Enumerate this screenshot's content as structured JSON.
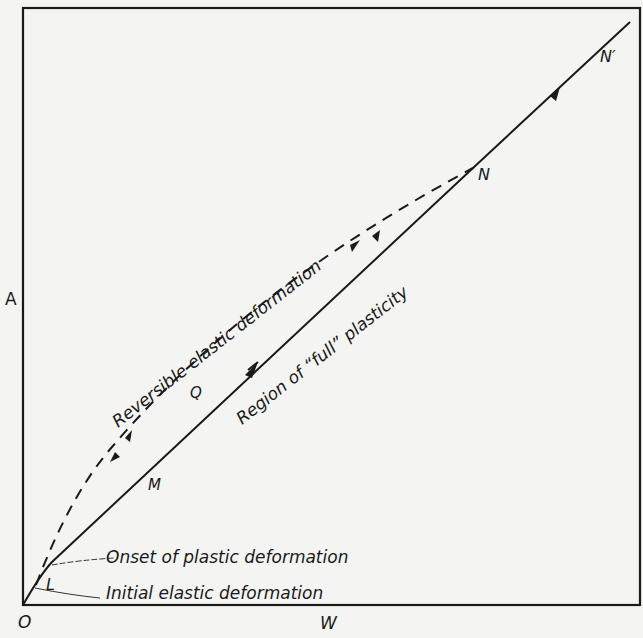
{
  "diagram": {
    "axes": {
      "y_label": "A",
      "x_label": "W",
      "origin_label": "O"
    },
    "points": {
      "L": "L",
      "M": "M",
      "Q": "Q",
      "N": "N",
      "N_prime": "N′"
    },
    "annotations": {
      "reversible": "Reversible elastic deformation",
      "plasticity": "Region of “full” plasticity",
      "onset": "Onset of plastic deformation",
      "initial": "Initial elastic deformation"
    },
    "colors": {
      "ink": "#1a1a1a",
      "paper": "#f4f4f2"
    }
  }
}
